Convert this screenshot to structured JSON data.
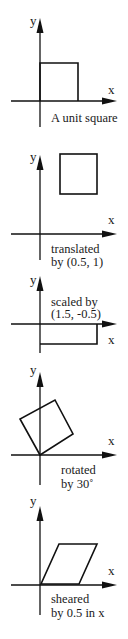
{
  "panels": [
    {
      "id": "unit-square",
      "axis_labels": {
        "x": "x",
        "y": "y"
      },
      "caption": [
        "A unit square"
      ],
      "transform": "identity",
      "shape_points": [
        [
          0,
          0
        ],
        [
          1,
          0
        ],
        [
          1,
          1
        ],
        [
          0,
          1
        ]
      ]
    },
    {
      "id": "translated",
      "axis_labels": {
        "x": "x",
        "y": "y"
      },
      "caption": [
        "translated",
        "by (0.5, 1)"
      ],
      "transform": "translate(0.5, 1)",
      "shape_points": [
        [
          0.5,
          1
        ],
        [
          1.5,
          1
        ],
        [
          1.5,
          2
        ],
        [
          0.5,
          2
        ]
      ]
    },
    {
      "id": "scaled",
      "axis_labels": {
        "x": "x",
        "y": "y"
      },
      "caption": [
        "scaled by",
        "(1.5, -0.5)"
      ],
      "transform": "scale(1.5, -0.5)",
      "shape_points": [
        [
          0,
          0
        ],
        [
          1.5,
          0
        ],
        [
          1.5,
          -0.5
        ],
        [
          0,
          -0.5
        ]
      ]
    },
    {
      "id": "rotated",
      "axis_labels": {
        "x": "x",
        "y": "y"
      },
      "caption": [
        "rotated",
        "by 30˚"
      ],
      "transform": "rotate(30deg)",
      "shape_points": [
        [
          0,
          0
        ],
        [
          0.866,
          0.5
        ],
        [
          0.366,
          1.366
        ],
        [
          -0.5,
          0.866
        ]
      ]
    },
    {
      "id": "sheared",
      "axis_labels": {
        "x": "x",
        "y": "y"
      },
      "caption": [
        "sheared",
        "by 0.5 in x"
      ],
      "transform": "shear_x(0.5)",
      "shape_points": [
        [
          0,
          0
        ],
        [
          1,
          0
        ],
        [
          1.5,
          1
        ],
        [
          0.5,
          1
        ]
      ]
    }
  ]
}
